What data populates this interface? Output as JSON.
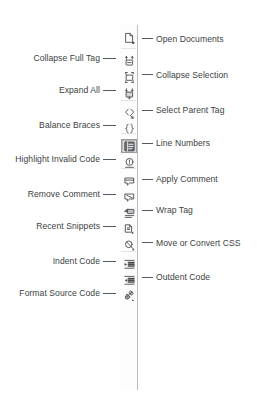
{
  "figure": {
    "accent_color": "#55585c",
    "text_color": "#3c3f43",
    "toolbar_border_color": "#b9bcc0",
    "toolbar_background": "#fdfdfd",
    "selected_highlight_color": "#dcdcdc"
  },
  "toolbar": {
    "name": "Coding toolbar",
    "orientation": "vertical",
    "buttons": [
      {
        "label": "Open Documents",
        "icon": "open-documents-icon",
        "side": "right",
        "selected": false,
        "icon_y": 31,
        "label_y": 34,
        "leader_y": 38
      },
      {
        "label": "Collapse Full Tag",
        "icon": "collapse-full-tag-icon",
        "side": "left",
        "selected": false,
        "icon_y": 54,
        "label_y": 53,
        "leader_y": 58
      },
      {
        "label": "Collapse Selection",
        "icon": "collapse-selection-icon",
        "side": "right",
        "selected": false,
        "icon_y": 70,
        "label_y": 70,
        "leader_y": 74
      },
      {
        "label": "Expand All",
        "icon": "expand-all-icon",
        "side": "left",
        "selected": false,
        "icon_y": 86,
        "label_y": 85,
        "leader_y": 90
      },
      {
        "label": "Select Parent Tag",
        "icon": "select-parent-tag-icon",
        "side": "right",
        "selected": false,
        "icon_y": 106,
        "label_y": 105,
        "leader_y": 110
      },
      {
        "label": "Balance Braces",
        "icon": "balance-braces-icon",
        "side": "left",
        "selected": false,
        "icon_y": 121,
        "label_y": 120,
        "leader_y": 125
      },
      {
        "label": "Line Numbers",
        "icon": "line-numbers-icon",
        "side": "right",
        "selected": true,
        "icon_y": 139,
        "label_y": 138,
        "leader_y": 143
      },
      {
        "label": "Highlight Invalid Code",
        "icon": "highlight-invalid-code-icon",
        "side": "left",
        "selected": false,
        "icon_y": 155,
        "label_y": 154,
        "leader_y": 159
      },
      {
        "label": "Apply Comment",
        "icon": "apply-comment-icon",
        "side": "right",
        "selected": false,
        "icon_y": 174,
        "label_y": 174,
        "leader_y": 179
      },
      {
        "label": "Remove Comment",
        "icon": "remove-comment-icon",
        "side": "left",
        "selected": false,
        "icon_y": 190,
        "label_y": 189,
        "leader_y": 194
      },
      {
        "label": "Wrap Tag",
        "icon": "wrap-tag-icon",
        "side": "right",
        "selected": false,
        "icon_y": 206,
        "label_y": 205,
        "leader_y": 210
      },
      {
        "label": "Recent Snippets",
        "icon": "recent-snippets-icon",
        "side": "left",
        "selected": false,
        "icon_y": 222,
        "label_y": 221,
        "leader_y": 226
      },
      {
        "label": "Move or Convert CSS",
        "icon": "move-or-convert-css-icon",
        "side": "right",
        "selected": false,
        "icon_y": 238,
        "label_y": 238,
        "leader_y": 242
      },
      {
        "label": "Indent Code",
        "icon": "indent-code-icon",
        "side": "left",
        "selected": false,
        "icon_y": 257,
        "label_y": 256,
        "leader_y": 261
      },
      {
        "label": "Outdent Code",
        "icon": "outdent-code-icon",
        "side": "right",
        "selected": false,
        "icon_y": 273,
        "label_y": 272,
        "leader_y": 277
      },
      {
        "label": "Format Source Code",
        "icon": "format-source-code-icon",
        "side": "left",
        "selected": false,
        "icon_y": 289,
        "label_y": 288,
        "leader_y": 293
      }
    ],
    "separators_y": [
      48,
      100,
      133,
      168,
      251
    ]
  }
}
